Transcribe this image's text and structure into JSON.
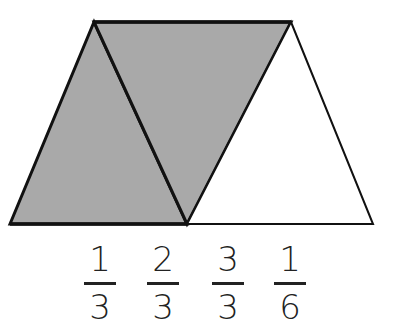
{
  "diagram": {
    "shape": "trapezoid divided into 3 equilateral triangles",
    "fill_color": "#a9a9a9",
    "stroke_color": "#111111",
    "triangles": [
      {
        "name": "left",
        "points": "10,224 94,22 187,224",
        "shaded": true
      },
      {
        "name": "middle-inverted",
        "points": "94,22 291,22 187,224",
        "shaded": true
      },
      {
        "name": "right",
        "points": "187,224 291,22 373,224",
        "shaded": false
      }
    ]
  },
  "choices": [
    {
      "numerator": "1",
      "denominator": "3",
      "x": 80
    },
    {
      "numerator": "2",
      "denominator": "3",
      "x": 143
    },
    {
      "numerator": "3",
      "denominator": "3",
      "x": 208
    },
    {
      "numerator": "1",
      "denominator": "6",
      "x": 270
    }
  ]
}
